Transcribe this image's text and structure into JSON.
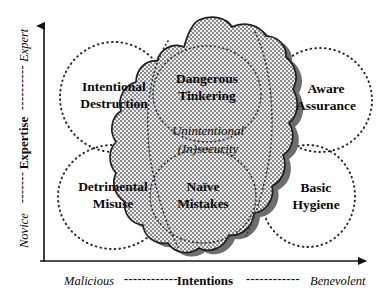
{
  "diagram": {
    "axes": {
      "y": {
        "name": "Expertise",
        "high_label": "Expert",
        "low_label": "Novice",
        "dash_high": "----------",
        "dash_low": "-------"
      },
      "x": {
        "name": "Intentions",
        "low_label": "Malicious",
        "high_label": "Benevolent",
        "dash_low": "------------",
        "dash_high": "------------"
      }
    },
    "quadrants": [
      {
        "id": "top-left",
        "line1": "Intentional",
        "line2": "Destruction"
      },
      {
        "id": "top-right",
        "line1": "Aware",
        "line2": "Assurance"
      },
      {
        "id": "bottom-left",
        "line1": "Detrimental",
        "line2": "Misuse"
      },
      {
        "id": "bottom-right",
        "line1": "Basic",
        "line2": "Hygiene"
      }
    ],
    "cloud_regions": [
      {
        "id": "cloud-top",
        "line1": "Dangerous",
        "line2": "Tinkering"
      },
      {
        "id": "cloud-bottom",
        "line1": "Naïve",
        "line2": "Mistakes"
      }
    ],
    "cloud_center": {
      "line1": "Unintentional",
      "line2": "(In)security"
    },
    "colors": {
      "ink": "#0a0a0a",
      "axis": "#1a1a1a",
      "dotted_circle": "#262626",
      "cloud_fill": "#d9d9d9",
      "cloud_outline": "#1f1f1f",
      "cloud_shadow": "#6e6e6e",
      "background": "#ffffff"
    }
  }
}
